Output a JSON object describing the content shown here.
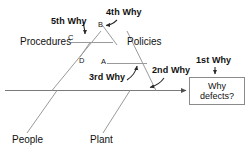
{
  "diagram": {
    "type": "fishbone-ishikawa",
    "title_text": "",
    "problem_box": {
      "line1": "Why",
      "line2": "defects?"
    },
    "categories": [
      {
        "id": "procedures",
        "label": "Procedures"
      },
      {
        "id": "policies",
        "label": "Policies"
      },
      {
        "id": "people",
        "label": "People"
      },
      {
        "id": "plant",
        "label": "Plant"
      }
    ],
    "point_labels": [
      {
        "id": "a",
        "label": "A"
      },
      {
        "id": "b",
        "label": "B"
      },
      {
        "id": "c",
        "label": "C"
      },
      {
        "id": "d",
        "label": "D"
      }
    ],
    "why_annotations": [
      {
        "id": "why1",
        "label": "1st Why"
      },
      {
        "id": "why2",
        "label": "2nd Why"
      },
      {
        "id": "why3",
        "label": "3rd Why"
      },
      {
        "id": "why4",
        "label": "4th Why"
      },
      {
        "id": "why5",
        "label": "5th Why"
      }
    ],
    "colors": {
      "line": "#8a8a8a",
      "spine": "#6e6e6e",
      "text": "#111111",
      "box_border": "#8a8a8a",
      "background": "#ffffff"
    }
  }
}
